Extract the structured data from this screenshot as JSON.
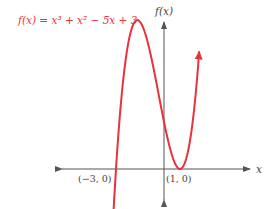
{
  "chart_data": {
    "type": "line",
    "title": "",
    "function_label": "f(x) = x³ + x² − 5x + 3",
    "xlabel": "x",
    "ylabel": "f(x)",
    "annotations": [
      {
        "label": "(−3, 0)",
        "x": -3,
        "y": 0
      },
      {
        "label": "(1, 0)",
        "x": 1,
        "y": 0
      }
    ],
    "series": [
      {
        "name": "f(x) = x³ + x² − 5x + 3",
        "x": [
          -3.2,
          -3.0,
          -2.5,
          -2.0,
          -1.67,
          -1.0,
          0.0,
          0.5,
          1.0,
          1.5,
          2.0,
          2.2
        ],
        "y": [
          -1.37,
          0.0,
          5.38,
          9.0,
          9.48,
          8.0,
          3.0,
          0.88,
          0.0,
          1.13,
          5.0,
          7.13
        ]
      }
    ],
    "grid": false,
    "legend": "none",
    "colors": {
      "curve": "#e8323c",
      "axes": "#555555",
      "label": "#e8323c"
    }
  }
}
